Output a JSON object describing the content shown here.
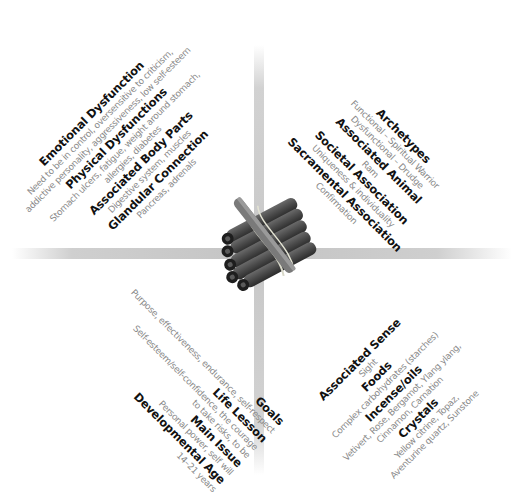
{
  "theme": {
    "heading_color": "#111111",
    "description_color": "#8a8a8a",
    "bar_color": "#c6c6c6",
    "background": "#ffffff"
  },
  "center_image": {
    "subject": "bundle of cinnamon sticks tied with twine",
    "icon": "cinnamon-bundle-icon"
  },
  "quadrants": {
    "top_left": {
      "lines": [
        {
          "type": "heading",
          "text": "Emotional Dysfunction"
        },
        {
          "type": "description",
          "text": "Need to be in control, oversensitive to criticism,"
        },
        {
          "type": "description",
          "text": "addictive personality, aggressiveness, low self-esteem"
        },
        {
          "type": "heading",
          "text": "Physical Dysfunctions"
        },
        {
          "type": "description",
          "text": "Stomach ulcers, fatigue, weight around stomach,"
        },
        {
          "type": "description",
          "text": "allergies, diabetes"
        },
        {
          "type": "heading",
          "text": "Associated Body Parts"
        },
        {
          "type": "description",
          "text": "Digestive system, muscles"
        },
        {
          "type": "heading",
          "text": "Glandular Connection"
        },
        {
          "type": "description",
          "text": "Pancreas, adrenals"
        }
      ]
    },
    "top_right": {
      "lines": [
        {
          "type": "heading",
          "text": "Archetypes"
        },
        {
          "type": "description",
          "text": "Functional – Spiritual Warrior"
        },
        {
          "type": "description",
          "text": "Dysfunctional – Drudge"
        },
        {
          "type": "heading",
          "text": "Associated Animal"
        },
        {
          "type": "description",
          "text": "Ram"
        },
        {
          "type": "heading",
          "text": "Societal Association"
        },
        {
          "type": "description",
          "text": "Uniqueness & individuality"
        },
        {
          "type": "heading",
          "text": "Sacramental Association"
        },
        {
          "type": "description",
          "text": "Confirmation"
        }
      ]
    },
    "bottom_left": {
      "lines": [
        {
          "type": "heading",
          "text": "Goals"
        },
        {
          "type": "description",
          "text": "Purpose, effectiveness, endurance, self-respect"
        },
        {
          "type": "heading",
          "text": "Life Lesson"
        },
        {
          "type": "description",
          "text": "Self-esteem/self-confidence, the courage"
        },
        {
          "type": "description",
          "text": "to take risks, to be"
        },
        {
          "type": "heading",
          "text": "Main Issue"
        },
        {
          "type": "description",
          "text": "Personal power, self will"
        },
        {
          "type": "heading",
          "text": "Developmental Age"
        },
        {
          "type": "description",
          "text": "14–21 years"
        }
      ]
    },
    "bottom_right": {
      "lines": [
        {
          "type": "heading",
          "text": "Associated Sense"
        },
        {
          "type": "description",
          "text": "Sight"
        },
        {
          "type": "heading",
          "text": "Foods"
        },
        {
          "type": "description",
          "text": "Complex carbohydrates (starches)"
        },
        {
          "type": "heading",
          "text": "Incense/oils"
        },
        {
          "type": "description",
          "text": "Vetivert, Rose, Bergamot, Ylang ylang,"
        },
        {
          "type": "description",
          "text": "Cinnamon, Carnation"
        },
        {
          "type": "heading",
          "text": "Crystals"
        },
        {
          "type": "description",
          "text": "Yellow citrine, Topaz,"
        },
        {
          "type": "description",
          "text": "Aventurine quartz, Sunstone"
        }
      ]
    }
  }
}
